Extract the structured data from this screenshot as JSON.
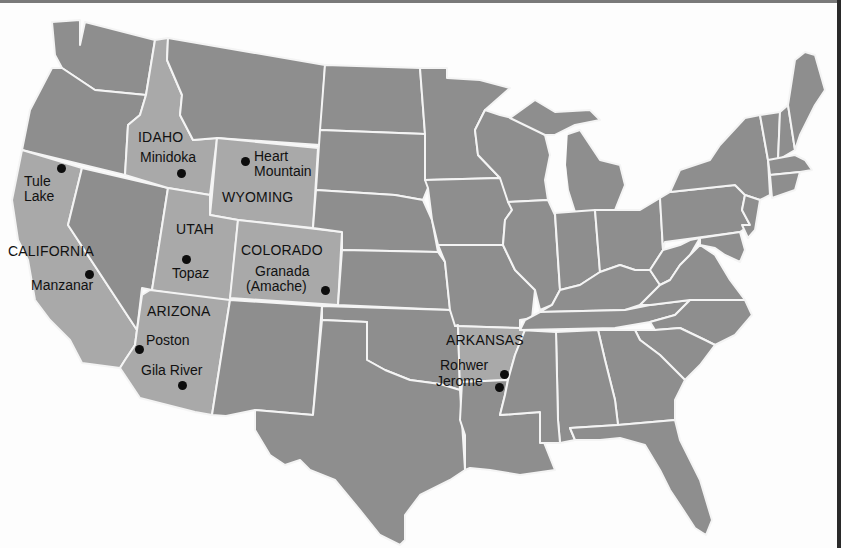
{
  "map": {
    "subject": "Japanese American internment camps, United States",
    "colors": {
      "state_fill": "#8e8e8e",
      "camp_state_fill": "#a9a9a9",
      "border": "#f4f4f4",
      "marker": "#0d0d0d",
      "label": "#111111"
    },
    "highlighted_states": [
      "CALIFORNIA",
      "IDAHO",
      "WYOMING",
      "UTAH",
      "COLORADO",
      "ARIZONA",
      "ARKANSAS"
    ],
    "state_labels": {
      "idaho": "IDAHO",
      "wyoming": "WYOMING",
      "utah": "UTAH",
      "california": "CALIFORNIA",
      "colorado": "COLORADO",
      "arizona": "ARIZONA",
      "arkansas": "ARKANSAS"
    },
    "camps": [
      {
        "id": "tule-lake",
        "line1": "Tule",
        "line2": "Lake",
        "state": "CALIFORNIA"
      },
      {
        "id": "manzanar",
        "line1": "Manzanar",
        "state": "CALIFORNIA"
      },
      {
        "id": "minidoka",
        "line1": "Minidoka",
        "state": "IDAHO"
      },
      {
        "id": "heart-mountain",
        "line1": "Heart",
        "line2": "Mountain",
        "state": "WYOMING"
      },
      {
        "id": "topaz",
        "line1": "Topaz",
        "state": "UTAH"
      },
      {
        "id": "granada",
        "line1": "Granada",
        "line2": "(Amache)",
        "state": "COLORADO"
      },
      {
        "id": "poston",
        "line1": "Poston",
        "state": "ARIZONA"
      },
      {
        "id": "gila-river",
        "line1": "Gila River",
        "state": "ARIZONA"
      },
      {
        "id": "rohwer",
        "line1": "Rohwer",
        "state": "ARKANSAS"
      },
      {
        "id": "jerome",
        "line1": "Jerome",
        "state": "ARKANSAS"
      }
    ]
  }
}
